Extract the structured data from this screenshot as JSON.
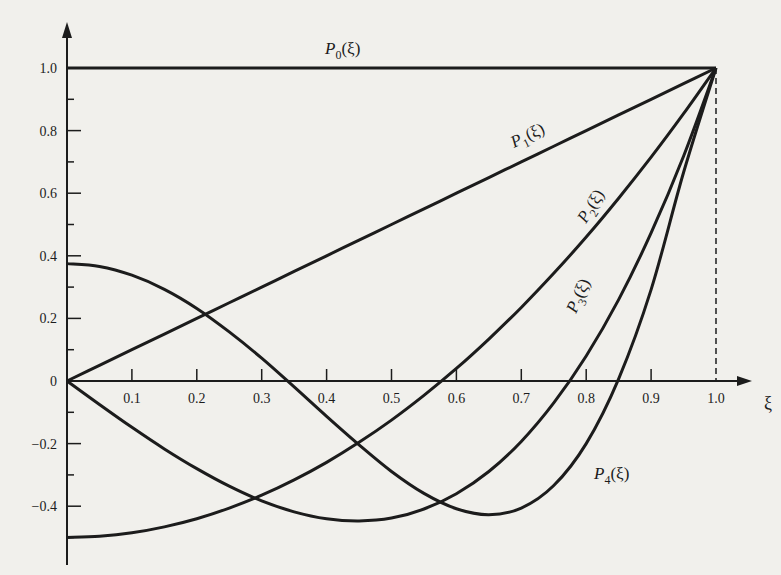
{
  "chart_data": {
    "type": "line",
    "title": "",
    "xlabel": "ξ",
    "ylabel": "",
    "xlim": [
      0,
      1.0
    ],
    "ylim": [
      -0.5,
      1.0
    ],
    "grid": false,
    "x_ticks": [
      "0.1",
      "0.2",
      "0.3",
      "0.4",
      "0.5",
      "0.6",
      "0.7",
      "0.8",
      "0.9",
      "1.0"
    ],
    "y_ticks": [
      "1.0",
      "0.8",
      "0.6",
      "0.4",
      "0.2",
      "0",
      "-0.2",
      "-0.4"
    ],
    "x": [
      0,
      0.05,
      0.1,
      0.15,
      0.2,
      0.25,
      0.3,
      0.35,
      0.4,
      0.45,
      0.5,
      0.55,
      0.6,
      0.65,
      0.7,
      0.75,
      0.8,
      0.85,
      0.9,
      0.95,
      1.0
    ],
    "series": [
      {
        "name": "P0(ξ)",
        "label_main": "P",
        "label_sub": "0",
        "label_arg": "(ξ)",
        "values": [
          1,
          1,
          1,
          1,
          1,
          1,
          1,
          1,
          1,
          1,
          1,
          1,
          1,
          1,
          1,
          1,
          1,
          1,
          1,
          1,
          1
        ]
      },
      {
        "name": "P1(ξ)",
        "label_main": "P",
        "label_sub": "1",
        "label_arg": "(ξ)",
        "values": [
          0,
          0.05,
          0.1,
          0.15,
          0.2,
          0.25,
          0.3,
          0.35,
          0.4,
          0.45,
          0.5,
          0.55,
          0.6,
          0.65,
          0.7,
          0.75,
          0.8,
          0.85,
          0.9,
          0.95,
          1.0
        ]
      },
      {
        "name": "P2(ξ)",
        "label_main": "P",
        "label_sub": "2",
        "label_arg": "(ξ)",
        "values": [
          -0.5,
          -0.496,
          -0.485,
          -0.466,
          -0.44,
          -0.406,
          -0.365,
          -0.316,
          -0.26,
          -0.196,
          -0.125,
          -0.046,
          0.04,
          0.134,
          0.235,
          0.344,
          0.46,
          0.584,
          0.715,
          0.854,
          1.0
        ]
      },
      {
        "name": "P3(ξ)",
        "label_main": "P",
        "label_sub": "3",
        "label_arg": "(ξ)",
        "values": [
          0,
          -0.075,
          -0.148,
          -0.217,
          -0.28,
          -0.336,
          -0.383,
          -0.418,
          -0.44,
          -0.447,
          -0.438,
          -0.409,
          -0.36,
          -0.289,
          -0.193,
          -0.07,
          0.08,
          0.26,
          0.473,
          0.718,
          1.0
        ]
      },
      {
        "name": "P4(ξ)",
        "label_main": "P",
        "label_sub": "4",
        "label_arg": "(ξ)",
        "values": [
          0.375,
          0.366,
          0.338,
          0.293,
          0.232,
          0.157,
          0.073,
          -0.019,
          -0.113,
          -0.204,
          -0.289,
          -0.359,
          -0.408,
          -0.427,
          -0.406,
          -0.334,
          -0.2,
          0.007,
          0.292,
          0.666,
          1.0
        ]
      }
    ],
    "annotations": [
      "dashed vertical line at ξ = 1.0",
      "arrowheads on both axes"
    ]
  }
}
